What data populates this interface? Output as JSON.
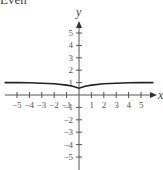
{
  "caption": "Even",
  "chart_data": {
    "type": "line",
    "title": "",
    "xlabel": "x",
    "ylabel": "y",
    "xlim": [
      -6,
      6
    ],
    "ylim": [
      -6,
      6
    ],
    "x_ticks": [
      -5,
      -4,
      -3,
      -2,
      -1,
      1,
      2,
      3,
      4,
      5
    ],
    "y_ticks": [
      -5,
      -4,
      -3,
      -2,
      -1,
      1,
      2,
      3,
      4,
      5
    ],
    "grid": false,
    "series": [
      {
        "name": "f(x)",
        "x": [
          -6,
          -5,
          -4,
          -3,
          -2,
          -1,
          -0.5,
          0,
          0.5,
          1,
          2,
          3,
          4,
          5,
          6
        ],
        "values": [
          1.0,
          1.0,
          0.98,
          0.95,
          0.9,
          0.8,
          0.7,
          0.55,
          0.7,
          0.8,
          0.9,
          0.95,
          0.98,
          1.0,
          1.0
        ]
      }
    ],
    "annotations": [
      "Even"
    ]
  }
}
